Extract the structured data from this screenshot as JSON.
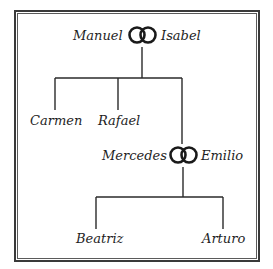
{
  "tree": {
    "couple1": {
      "partner_a": "Manuel",
      "partner_b": "Isabel",
      "symbol": "wedding-rings-icon"
    },
    "children1": [
      {
        "name": "Carmen"
      },
      {
        "name": "Rafael"
      }
    ],
    "couple2": {
      "partner_a": "Mercedes",
      "partner_b": "Emilio",
      "symbol": "wedding-rings-icon"
    },
    "children2": [
      {
        "name": "Beatriz"
      },
      {
        "name": "Arturo"
      }
    ]
  },
  "colors": {
    "line": "#2a2a2a",
    "text": "#1e1e1e",
    "border": "#3a3a3a"
  }
}
